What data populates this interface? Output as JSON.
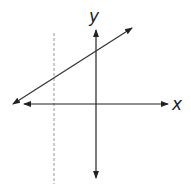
{
  "diagram": {
    "type": "coordinate-plane",
    "x_axis_label": "x",
    "y_axis_label": "y",
    "colors": {
      "axis": "#222222",
      "line": "#333333",
      "dashed": "#999999"
    },
    "elements": [
      {
        "name": "x-axis",
        "kind": "double-arrow",
        "from": [
          22,
          104
        ],
        "to": [
          170,
          104
        ]
      },
      {
        "name": "y-axis",
        "kind": "double-arrow",
        "from": [
          96,
          28
        ],
        "to": [
          96,
          180
        ]
      },
      {
        "name": "sloped-line",
        "kind": "double-arrow",
        "from": [
          12,
          105
        ],
        "to": [
          133,
          27
        ]
      },
      {
        "name": "vertical-dashed-line",
        "kind": "dashed",
        "from": [
          54,
          33
        ],
        "to": [
          54,
          184
        ]
      }
    ]
  }
}
